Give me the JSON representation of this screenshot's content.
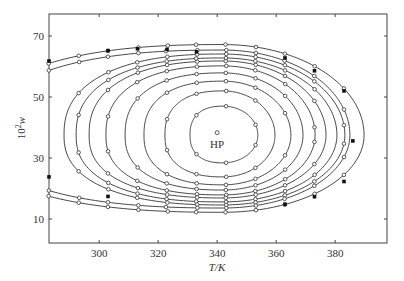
{
  "chart_data": {
    "type": "line",
    "title": "",
    "xlabel": "T/K",
    "ylabel": "10^2 w",
    "xlim": [
      283,
      397
    ],
    "ylim": [
      3,
      77
    ],
    "x_ticks": [
      300,
      320,
      340,
      360,
      380
    ],
    "y_ticks": [
      10,
      30,
      50,
      70
    ],
    "grid": false,
    "legend": null,
    "annotations": [
      {
        "text": "HP",
        "x": 340,
        "y": 38
      }
    ],
    "hp_point": {
      "x": 340,
      "y": 38.3
    },
    "closed_curves": [
      {
        "name": "curve-1",
        "center": [
          342,
          37.5
        ],
        "left": 330.8,
        "right": 353.8,
        "top": 47.0,
        "bottom": 28.4
      },
      {
        "name": "curve-2",
        "center": [
          342,
          37.5
        ],
        "left": 322.3,
        "right": 359.6,
        "top": 52.0,
        "bottom": 23.8
      },
      {
        "name": "curve-3",
        "center": [
          342,
          37.5
        ],
        "left": 315.2,
        "right": 365.0,
        "top": 55.2,
        "bottom": 21.2
      },
      {
        "name": "curve-4",
        "center": [
          342,
          37.5
        ],
        "left": 308.8,
        "right": 369.1,
        "top": 57.9,
        "bottom": 19.5
      },
      {
        "name": "curve-5",
        "center": [
          342,
          37.5
        ],
        "left": 302.3,
        "right": 373.2,
        "top": 60.2,
        "bottom": 17.9
      },
      {
        "name": "curve-6",
        "center": [
          342,
          37.5
        ],
        "left": 296.6,
        "right": 376.9,
        "top": 61.8,
        "bottom": 16.9
      },
      {
        "name": "curve-7",
        "center": [
          342,
          37.5
        ],
        "left": 292.2,
        "right": 380.6,
        "top": 62.8,
        "bottom": 15.6
      },
      {
        "name": "curve-8",
        "center": [
          342,
          37.5
        ],
        "left": 288.1,
        "right": 383.3,
        "top": 64.1,
        "bottom": 14.6
      }
    ],
    "open_curves": [
      {
        "name": "curve-9",
        "center": [
          342,
          37.5
        ],
        "left": 262.0,
        "right": 385.0,
        "top": 65.4,
        "bottom": 13.6
      },
      {
        "name": "curve-10",
        "center": [
          342,
          37.5
        ],
        "left": 258.0,
        "right": 389.8,
        "top": 67.2,
        "bottom": 12.2
      }
    ],
    "open_markers_T": [
      283,
      293,
      303,
      313,
      323,
      333,
      343,
      353,
      363,
      373,
      383
    ],
    "filled_markers": [
      {
        "x": 283,
        "y": 61.8
      },
      {
        "x": 283,
        "y": 23.8
      },
      {
        "x": 303,
        "y": 65.2
      },
      {
        "x": 303,
        "y": 17.4
      },
      {
        "x": 313,
        "y": 65.8
      },
      {
        "x": 323,
        "y": 65.6
      },
      {
        "x": 333,
        "y": 64.8
      },
      {
        "x": 363,
        "y": 62.8
      },
      {
        "x": 373,
        "y": 58.6
      },
      {
        "x": 383,
        "y": 52.0
      },
      {
        "x": 386,
        "y": 35.6
      },
      {
        "x": 383,
        "y": 22.3
      },
      {
        "x": 373,
        "y": 17.3
      },
      {
        "x": 363,
        "y": 14.8
      }
    ]
  }
}
